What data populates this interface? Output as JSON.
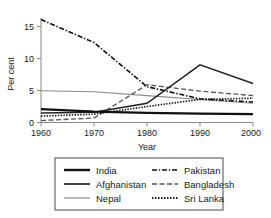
{
  "chart_data": {
    "type": "line",
    "title": "",
    "xlabel": "Year",
    "ylabel": "Per cent",
    "x": [
      1960,
      1970,
      1980,
      1990,
      2000
    ],
    "xticklabels": [
      "1960",
      "1970",
      "1980",
      "1990",
      "2000"
    ],
    "yticklabels": [
      "0",
      "5",
      "10",
      "15"
    ],
    "yticks": [
      0,
      5,
      10,
      15
    ],
    "xlim": [
      1960,
      2000
    ],
    "ylim": [
      0,
      16.5
    ],
    "grid": false,
    "legend_position": "below-center",
    "series": [
      {
        "name": "India",
        "style": "solid-thick",
        "color": "#111111",
        "values": [
          2.1,
          1.7,
          1.5,
          1.4,
          1.3
        ]
      },
      {
        "name": "Afghanistan",
        "style": "solid-medium",
        "color": "#222222",
        "values": [
          1.5,
          1.6,
          3.0,
          9.0,
          6.1
        ]
      },
      {
        "name": "Nepal",
        "style": "solid-thin-grey",
        "color": "#8a8a8a",
        "values": [
          4.95,
          4.8,
          4.2,
          3.6,
          3.0
        ]
      },
      {
        "name": "Pakistan",
        "style": "dash-dot",
        "color": "#111111",
        "values": [
          16.1,
          12.5,
          5.6,
          3.7,
          3.2
        ]
      },
      {
        "name": "Bangladesh",
        "style": "dashed",
        "color": "#555555",
        "values": [
          0.3,
          0.7,
          5.9,
          4.9,
          4.2
        ]
      },
      {
        "name": "Sri Lanka",
        "style": "dotted",
        "color": "#1a1a1a",
        "values": [
          1.0,
          1.3,
          2.5,
          3.6,
          3.8
        ]
      }
    ]
  },
  "axes": {
    "ylabel": "Per cent",
    "xlabel": "Year",
    "ytick_0": "0",
    "ytick_5": "5",
    "ytick_10": "10",
    "ytick_15": "15",
    "xtick_1960": "1960",
    "xtick_1970": "1970",
    "xtick_1980": "1980",
    "xtick_1990": "1990",
    "xtick_2000": "2000"
  },
  "legend": {
    "entries": [
      {
        "label": "India",
        "style": "solid-thick"
      },
      {
        "label": "Afghanistan",
        "style": "solid-medium"
      },
      {
        "label": "Nepal",
        "style": "solid-thin-grey"
      },
      {
        "label": "Pakistan",
        "style": "dash-dot"
      },
      {
        "label": "Bangladesh",
        "style": "dashed"
      },
      {
        "label": "Sri Lanka",
        "style": "dotted"
      }
    ]
  },
  "colors": {
    "axis": "#7a7a7a",
    "text": "#1a1a1a",
    "legend_border": "#4a4a4a",
    "background": "#ffffff"
  }
}
